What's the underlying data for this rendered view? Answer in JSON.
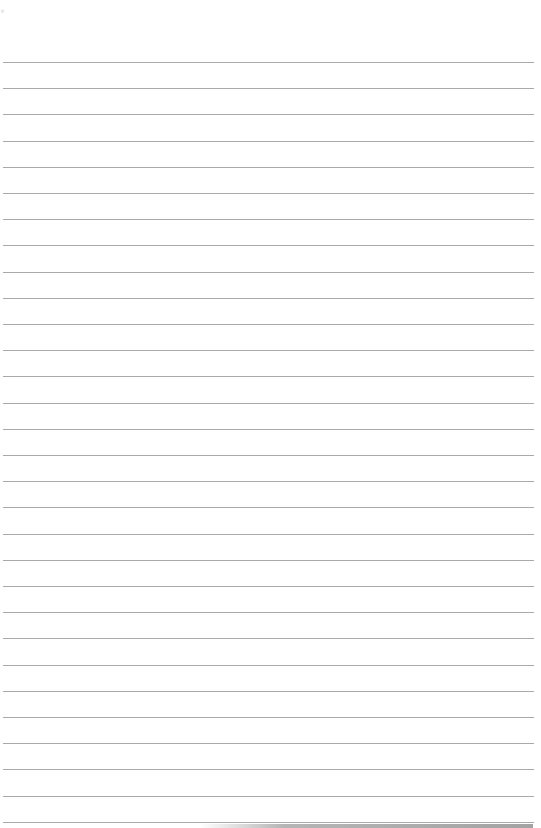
{
  "page": {
    "type": "ruled-paper",
    "corner_mark": "ir",
    "line_count": 30,
    "first_line_top": 62,
    "line_spacing": 26.2,
    "line_color": "#a9a9a9",
    "background_color": "#ffffff"
  }
}
